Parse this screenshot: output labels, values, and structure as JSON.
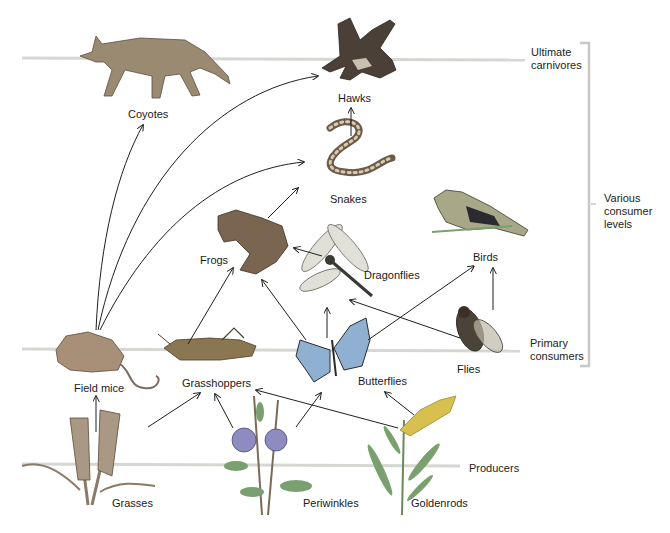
{
  "levels": [
    {
      "id": "ultimate",
      "label_line1": "Ultimate",
      "label_line2": "carnivores"
    },
    {
      "id": "various",
      "label_line1": "Various",
      "label_line2": "consumer",
      "label_line3": "levels"
    },
    {
      "id": "primary",
      "label_line1": "Primary",
      "label_line2": "consumers"
    },
    {
      "id": "producers",
      "label_line1": "Producers"
    }
  ],
  "organisms": {
    "coyotes": "Coyotes",
    "hawks": "Hawks",
    "snakes": "Snakes",
    "frogs": "Frogs",
    "dragonflies": "Dragonflies",
    "birds": "Birds",
    "field_mice": "Field mice",
    "grasshoppers": "Grasshoppers",
    "butterflies": "Butterflies",
    "flies": "Flies",
    "grasses": "Grasses",
    "periwinkles": "Periwinkles",
    "goldenrods": "Goldenrods"
  },
  "feeding_links": [
    {
      "from": "field_mice",
      "to": "coyotes"
    },
    {
      "from": "field_mice",
      "to": "hawks"
    },
    {
      "from": "field_mice",
      "to": "snakes"
    },
    {
      "from": "snakes",
      "to": "hawks"
    },
    {
      "from": "frogs",
      "to": "snakes"
    },
    {
      "from": "dragonflies",
      "to": "frogs"
    },
    {
      "from": "grasshoppers",
      "to": "frogs"
    },
    {
      "from": "butterflies",
      "to": "frogs"
    },
    {
      "from": "butterflies",
      "to": "dragonflies"
    },
    {
      "from": "flies",
      "to": "dragonflies"
    },
    {
      "from": "butterflies",
      "to": "birds"
    },
    {
      "from": "flies",
      "to": "birds"
    },
    {
      "from": "grasses",
      "to": "field_mice"
    },
    {
      "from": "grasses",
      "to": "grasshoppers"
    },
    {
      "from": "periwinkles",
      "to": "grasshoppers"
    },
    {
      "from": "periwinkles",
      "to": "butterflies"
    },
    {
      "from": "goldenrods",
      "to": "grasshoppers"
    },
    {
      "from": "goldenrods",
      "to": "butterflies"
    }
  ],
  "colors": {
    "level_line": "#d6d6d2",
    "arrow": "#1f1f1f",
    "coyote": "#9a8a72",
    "hawk": "#4a4038",
    "snake": "#6b5a48",
    "frog": "#7a6650",
    "dragonfly": "#8a8a80",
    "bird": "#a8a888",
    "mouse": "#a89078",
    "grasshopper": "#8a7650",
    "butterfly": "#8fb0d0",
    "fly": "#4a4438",
    "grass": "#8a7a68",
    "periwinkle": "#8c8cc0",
    "goldenrod": "#d8c050",
    "leaf": "#7aa070"
  }
}
